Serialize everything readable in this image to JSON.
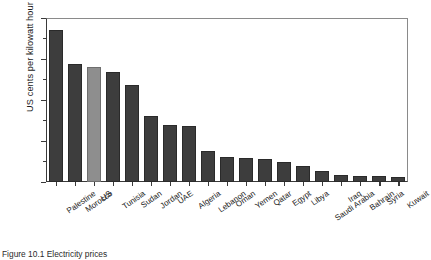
{
  "chart_data": {
    "type": "bar",
    "title": "",
    "xlabel": "",
    "ylabel": "US cents per kilowatt hour",
    "ylim": [
      0,
      16
    ],
    "yticks": [
      0,
      4,
      8,
      12,
      16
    ],
    "ytick_labels": [
      "0",
      "4",
      "8",
      "12",
      "16"
    ],
    "grid": false,
    "legend": "none",
    "highlight_category": "US",
    "colors": {
      "bar": "#3d3d3d",
      "bar_highlight": "#8e8e8e",
      "axis": "#3a3a3a",
      "text": "#1c1c1c"
    },
    "categories": [
      "Palestine",
      "Morocco",
      "US",
      "Tunisia",
      "Sudan",
      "Jordan",
      "UAE",
      "Algeria",
      "Lebanon",
      "Oman",
      "Yemen",
      "Qatar",
      "Egypt",
      "Libya",
      "Saudi Arabia",
      "Iraq",
      "Bahrain",
      "Syria",
      "Kuwait"
    ],
    "values": [
      14.8,
      11.5,
      11.2,
      10.7,
      9.5,
      6.4,
      5.6,
      5.5,
      3.0,
      2.4,
      2.3,
      2.2,
      2.0,
      1.6,
      1.1,
      0.7,
      0.6,
      0.6,
      0.5
    ]
  },
  "caption": {
    "text": "Figure 10.1  Electricity prices"
  }
}
